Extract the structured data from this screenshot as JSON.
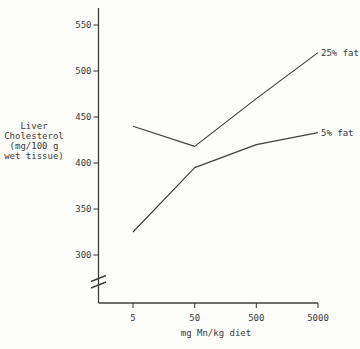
{
  "figure": {
    "background": "#fcfcfa",
    "ink_color": "#3f3f3f",
    "text_color": "#3a3a3a"
  },
  "chart_data": {
    "type": "line",
    "title": "",
    "xlabel": "mg Mn/kg diet",
    "ylabel": "Liver Cholesterol (mg/100 g wet tissue)",
    "ylabel_lines": [
      "Liver",
      "Cholesterol",
      "(mg/100 g",
      "wet tissue)"
    ],
    "x_scale": "log-category",
    "categories": [
      5,
      50,
      500,
      5000
    ],
    "x_tick_labels": [
      "5",
      "50",
      "500",
      "5000"
    ],
    "y_ticks": [
      300,
      350,
      400,
      450,
      500,
      550
    ],
    "y_tick_labels": [
      "300",
      "350",
      "400",
      "450",
      "500",
      "550"
    ],
    "ylim": [
      300,
      550
    ],
    "y_axis_break_below": 300,
    "grid": false,
    "legend_position": "inline-right-of-lines",
    "series": [
      {
        "name": "25% fat",
        "label": "25% fat",
        "values": [
          440,
          418,
          470,
          520
        ]
      },
      {
        "name": "5% fat",
        "label": "5% fat",
        "values": [
          325,
          395,
          420,
          433
        ]
      }
    ]
  }
}
